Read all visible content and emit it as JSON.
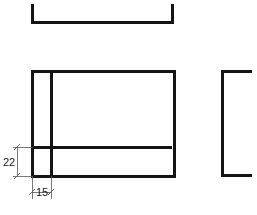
{
  "drawing": {
    "title": "Orthographic projection of channel section",
    "background_color": "#ffffff",
    "line_color": "#141414",
    "dimension_line_color": "#555555",
    "object_line_width": 3,
    "dimension_line_width": 0.8,
    "views": {
      "top_view": {
        "name": "top-view-channel-profile",
        "shape": "u-channel",
        "left": 31,
        "right": 173,
        "top": 5,
        "bottom": 22,
        "description": "U shaped channel profile seen in plan with two short upturned legs"
      },
      "front_view": {
        "name": "front-view-rectangle",
        "shape": "rectangle-with-internal-lines",
        "left": 31,
        "right": 173,
        "top": 70,
        "bottom": 176,
        "internal_vertical_line_x": 51,
        "internal_horizontal_line_y": 147
      },
      "side_view": {
        "name": "side-view-c-bracket",
        "shape": "c-bracket",
        "left": 220,
        "right": 250,
        "top": 70,
        "bottom": 176,
        "description": "C shaped bracket open to the right"
      }
    },
    "dimensions": [
      {
        "id": "dim-22",
        "label": "22",
        "orientation": "vertical",
        "value": 22,
        "measures": "height of lower band of front view",
        "line_x": 17,
        "from_y": 147,
        "to_y": 176,
        "text_x": 9,
        "text_y": 165,
        "extension_from_x": 17,
        "extension_to_x": 33
      },
      {
        "id": "dim-15",
        "label": "15",
        "orientation": "horizontal",
        "value": 15,
        "measures": "width of left band of front view",
        "line_y": 192,
        "from_x": 32,
        "to_x": 51,
        "text_x": 36,
        "text_y": 196,
        "extension_from_y": 176,
        "extension_to_y": 198
      }
    ]
  }
}
